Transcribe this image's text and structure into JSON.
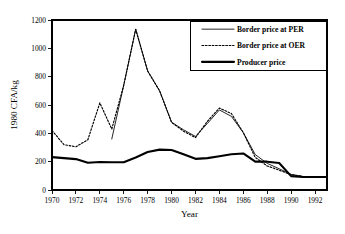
{
  "chart_data": {
    "type": "line",
    "title": "",
    "xlabel": "Year",
    "ylabel": "1980 CFA/kg",
    "xlim": [
      1970,
      1993
    ],
    "ylim": [
      0,
      1200
    ],
    "xticks": [
      1970,
      1972,
      1974,
      1976,
      1978,
      1980,
      1982,
      1984,
      1986,
      1988,
      1990,
      1992
    ],
    "yticks": [
      0,
      200,
      400,
      600,
      800,
      1000,
      1200
    ],
    "xtick_labels": [
      "1970",
      "1972",
      "1974",
      "1976",
      "1978",
      "1980",
      "1982",
      "1984",
      "1986",
      "1988",
      "1990",
      "1992"
    ],
    "ytick_labels": [
      "0",
      "200",
      "400",
      "600",
      "800",
      "1000",
      "1200"
    ],
    "grid": false,
    "legend_position": "top-right",
    "series": [
      {
        "name": "Border price at PER",
        "style": "solid-thin",
        "x": [
          1975,
          1976,
          1977,
          1978,
          1979,
          1980,
          1981,
          1982,
          1983,
          1984,
          1985,
          1986,
          1987,
          1988,
          1989,
          1990,
          1991,
          1992,
          1993
        ],
        "values": [
          360,
          740,
          1135,
          840,
          700,
          478,
          425,
          378,
          470,
          565,
          520,
          405,
          250,
          188,
          150,
          110,
          95,
          92,
          92
        ]
      },
      {
        "name": "Border price at OER",
        "style": "dotted",
        "x": [
          1970,
          1971,
          1972,
          1973,
          1974,
          1975,
          1976,
          1977,
          1978,
          1979,
          1980,
          1981,
          1982,
          1983,
          1984,
          1985,
          1986,
          1987,
          1988,
          1989,
          1990,
          1991,
          1992,
          1993
        ],
        "values": [
          420,
          320,
          305,
          355,
          615,
          430,
          740,
          1135,
          840,
          700,
          478,
          415,
          370,
          485,
          578,
          540,
          405,
          230,
          170,
          140,
          108,
          95,
          92,
          92
        ]
      },
      {
        "name": "Producer price",
        "style": "solid-thick",
        "x": [
          1970,
          1971,
          1972,
          1973,
          1974,
          1975,
          1976,
          1977,
          1978,
          1979,
          1980,
          1981,
          1982,
          1983,
          1984,
          1985,
          1986,
          1987,
          1988,
          1989,
          1990,
          1991,
          1992,
          1993
        ],
        "values": [
          232,
          225,
          218,
          192,
          198,
          196,
          196,
          230,
          268,
          285,
          282,
          252,
          220,
          225,
          238,
          252,
          258,
          200,
          200,
          190,
          98,
          92,
          92,
          92
        ]
      }
    ]
  },
  "legend": {
    "items": [
      {
        "label": "Border price at PER",
        "style": "solid-thin"
      },
      {
        "label": "Border price at OER",
        "style": "dotted"
      },
      {
        "label": "Producer price",
        "style": "solid-thick"
      }
    ]
  },
  "colors": {
    "foreground": "#000000",
    "background": "#ffffff"
  }
}
